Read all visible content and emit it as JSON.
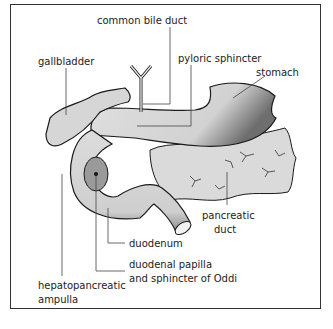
{
  "diagram": {
    "type": "anatomical-illustration",
    "colors": {
      "organ_fill": "#d9d9d9",
      "shade": "#8a8a8a",
      "outline": "#1a1a1a",
      "frame": "#333333"
    },
    "labels": {
      "common_bile_duct": "common bile duct",
      "gallbladder": "gallbladder",
      "pyloric_sphincter": "pyloric sphincter",
      "stomach": "stomach",
      "pancreatic_duct_1": "pancreatic",
      "pancreatic_duct_2": "duct",
      "duodenum": "duodenum",
      "papilla_1": "duodenal papilla",
      "papilla_2": "and sphincter of Oddi",
      "ampulla_1": "hepatopancreatic",
      "ampulla_2": "ampulla"
    }
  }
}
